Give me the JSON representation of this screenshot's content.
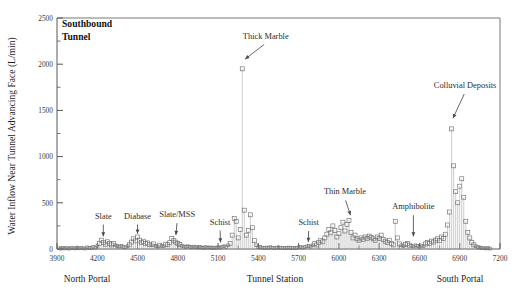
{
  "figure": {
    "panel_title_line1": "Southbound",
    "panel_title_line2": "Tunnel",
    "left_portal_label": "North Portal",
    "right_portal_label": "South Portal"
  },
  "chart_data": {
    "type": "scatter",
    "title": "Southbound Tunnel",
    "xlabel": "Tunnel Station",
    "ylabel": "Water Inflow Near Tunnel Advancing Face (L/min)",
    "xlim": [
      3900,
      7200
    ],
    "ylim": [
      0,
      2500
    ],
    "xticks": [
      3900,
      4200,
      4500,
      4800,
      5100,
      5400,
      5700,
      6000,
      6300,
      6600,
      6900,
      7200
    ],
    "yticks": [
      0,
      500,
      1000,
      1500,
      2000,
      2500
    ],
    "x_minor_interval": 150,
    "y_minor_interval": 250,
    "grid": false,
    "legend": "none",
    "marker_style": "open-square-with-dropline",
    "series": [
      {
        "name": "Water inflow near advancing face",
        "points": [
          [
            3915,
            8
          ],
          [
            3930,
            5
          ],
          [
            3945,
            12
          ],
          [
            3960,
            6
          ],
          [
            3975,
            10
          ],
          [
            3990,
            4
          ],
          [
            4005,
            14
          ],
          [
            4020,
            9
          ],
          [
            4035,
            6
          ],
          [
            4050,
            11
          ],
          [
            4065,
            7
          ],
          [
            4080,
            13
          ],
          [
            4095,
            8
          ],
          [
            4110,
            5
          ],
          [
            4125,
            18
          ],
          [
            4140,
            12
          ],
          [
            4155,
            9
          ],
          [
            4170,
            22
          ],
          [
            4185,
            15
          ],
          [
            4200,
            30
          ],
          [
            4215,
            62
          ],
          [
            4230,
            95
          ],
          [
            4245,
            70
          ],
          [
            4260,
            52
          ],
          [
            4275,
            78
          ],
          [
            4290,
            60
          ],
          [
            4305,
            44
          ],
          [
            4320,
            58
          ],
          [
            4335,
            40
          ],
          [
            4350,
            33
          ],
          [
            4365,
            26
          ],
          [
            4380,
            35
          ],
          [
            4395,
            22
          ],
          [
            4410,
            18
          ],
          [
            4425,
            30
          ],
          [
            4440,
            46
          ],
          [
            4455,
            75
          ],
          [
            4470,
            110
          ],
          [
            4485,
            88
          ],
          [
            4500,
            130
          ],
          [
            4515,
            96
          ],
          [
            4530,
            72
          ],
          [
            4545,
            84
          ],
          [
            4560,
            58
          ],
          [
            4575,
            66
          ],
          [
            4590,
            48
          ],
          [
            4605,
            40
          ],
          [
            4620,
            55
          ],
          [
            4635,
            34
          ],
          [
            4650,
            28
          ],
          [
            4665,
            42
          ],
          [
            4680,
            36
          ],
          [
            4695,
            30
          ],
          [
            4710,
            52
          ],
          [
            4725,
            46
          ],
          [
            4740,
            68
          ],
          [
            4755,
            115
          ],
          [
            4770,
            90
          ],
          [
            4785,
            74
          ],
          [
            4800,
            60
          ],
          [
            4815,
            48
          ],
          [
            4830,
            36
          ],
          [
            4845,
            28
          ],
          [
            4860,
            22
          ],
          [
            4875,
            30
          ],
          [
            4890,
            24
          ],
          [
            4905,
            18
          ],
          [
            4920,
            26
          ],
          [
            4935,
            20
          ],
          [
            4950,
            15
          ],
          [
            4965,
            22
          ],
          [
            4980,
            17
          ],
          [
            4995,
            12
          ],
          [
            5010,
            20
          ],
          [
            5025,
            14
          ],
          [
            5040,
            18
          ],
          [
            5055,
            10
          ],
          [
            5070,
            16
          ],
          [
            5085,
            12
          ],
          [
            5100,
            20
          ],
          [
            5115,
            14
          ],
          [
            5130,
            24
          ],
          [
            5145,
            30
          ],
          [
            5160,
            22
          ],
          [
            5175,
            40
          ],
          [
            5190,
            60
          ],
          [
            5205,
            150
          ],
          [
            5220,
            330
          ],
          [
            5235,
            300
          ],
          [
            5250,
            120
          ],
          [
            5265,
            210
          ],
          [
            5280,
            1950
          ],
          [
            5295,
            420
          ],
          [
            5310,
            150
          ],
          [
            5325,
            200
          ],
          [
            5340,
            370
          ],
          [
            5355,
            230
          ],
          [
            5370,
            90
          ],
          [
            5385,
            40
          ],
          [
            5400,
            18
          ],
          [
            5415,
            22
          ],
          [
            5430,
            14
          ],
          [
            5445,
            10
          ],
          [
            5460,
            16
          ],
          [
            5475,
            12
          ],
          [
            5490,
            20
          ],
          [
            5505,
            14
          ],
          [
            5520,
            8
          ],
          [
            5535,
            12
          ],
          [
            5550,
            18
          ],
          [
            5565,
            10
          ],
          [
            5580,
            14
          ],
          [
            5595,
            8
          ],
          [
            5610,
            12
          ],
          [
            5625,
            16
          ],
          [
            5640,
            10
          ],
          [
            5655,
            14
          ],
          [
            5670,
            8
          ],
          [
            5685,
            12
          ],
          [
            5700,
            18
          ],
          [
            5715,
            22
          ],
          [
            5730,
            14
          ],
          [
            5745,
            20
          ],
          [
            5760,
            28
          ],
          [
            5775,
            34
          ],
          [
            5790,
            26
          ],
          [
            5805,
            40
          ],
          [
            5820,
            58
          ],
          [
            5835,
            44
          ],
          [
            5850,
            70
          ],
          [
            5865,
            95
          ],
          [
            5880,
            78
          ],
          [
            5895,
            120
          ],
          [
            5910,
            160
          ],
          [
            5925,
            210
          ],
          [
            5940,
            175
          ],
          [
            5955,
            250
          ],
          [
            5970,
            200
          ],
          [
            5985,
            130
          ],
          [
            6000,
            165
          ],
          [
            6015,
            230
          ],
          [
            6030,
            290
          ],
          [
            6045,
            195
          ],
          [
            6060,
            265
          ],
          [
            6075,
            310
          ],
          [
            6090,
            180
          ],
          [
            6105,
            120
          ],
          [
            6120,
            150
          ],
          [
            6135,
            110
          ],
          [
            6150,
            95
          ],
          [
            6165,
            120
          ],
          [
            6180,
            105
          ],
          [
            6195,
            130
          ],
          [
            6210,
            115
          ],
          [
            6225,
            140
          ],
          [
            6240,
            125
          ],
          [
            6255,
            110
          ],
          [
            6270,
            95
          ],
          [
            6285,
            130
          ],
          [
            6300,
            115
          ],
          [
            6315,
            150
          ],
          [
            6330,
            105
          ],
          [
            6345,
            85
          ],
          [
            6360,
            70
          ],
          [
            6375,
            95
          ],
          [
            6390,
            60
          ],
          [
            6405,
            45
          ],
          [
            6420,
            300
          ],
          [
            6435,
            120
          ],
          [
            6450,
            55
          ],
          [
            6465,
            40
          ],
          [
            6480,
            30
          ],
          [
            6495,
            48
          ],
          [
            6510,
            60
          ],
          [
            6525,
            42
          ],
          [
            6540,
            35
          ],
          [
            6555,
            28
          ],
          [
            6570,
            40
          ],
          [
            6585,
            32
          ],
          [
            6600,
            25
          ],
          [
            6615,
            38
          ],
          [
            6630,
            30
          ],
          [
            6645,
            55
          ],
          [
            6660,
            70
          ],
          [
            6675,
            60
          ],
          [
            6690,
            85
          ],
          [
            6705,
            75
          ],
          [
            6720,
            95
          ],
          [
            6735,
            110
          ],
          [
            6750,
            90
          ],
          [
            6765,
            130
          ],
          [
            6780,
            115
          ],
          [
            6795,
            160
          ],
          [
            6810,
            260
          ],
          [
            6825,
            400
          ],
          [
            6840,
            1300
          ],
          [
            6855,
            900
          ],
          [
            6870,
            620
          ],
          [
            6885,
            500
          ],
          [
            6900,
            680
          ],
          [
            6915,
            760
          ],
          [
            6930,
            560
          ],
          [
            6945,
            300
          ],
          [
            6960,
            180
          ],
          [
            6975,
            120
          ],
          [
            6990,
            70
          ],
          [
            7005,
            45
          ],
          [
            7020,
            30
          ],
          [
            7035,
            20
          ],
          [
            7050,
            14
          ],
          [
            7065,
            10
          ],
          [
            7080,
            8
          ],
          [
            7095,
            6
          ],
          [
            7110,
            10
          ],
          [
            7125,
            5
          ]
        ]
      }
    ],
    "annotations": [
      {
        "label": "Slate",
        "x": 4245,
        "y": 330,
        "tip_x": 4245,
        "tip_y": 120
      },
      {
        "label": "Diabase",
        "x": 4500,
        "y": 330,
        "tip_x": 4500,
        "tip_y": 150
      },
      {
        "label": "Slate/MSS",
        "x": 4795,
        "y": 345,
        "tip_x": 4785,
        "tip_y": 135
      },
      {
        "label": "Schist",
        "x": 5115,
        "y": 265,
        "tip_x": 5118,
        "tip_y": 55
      },
      {
        "label": "Thick Marble",
        "x": 5455,
        "y": 2270,
        "tip_x": 5292,
        "tip_y": 2045
      },
      {
        "label": "Schist",
        "x": 5775,
        "y": 260,
        "tip_x": 5772,
        "tip_y": 60
      },
      {
        "label": "Thin Marble",
        "x": 6045,
        "y": 590,
        "tip_x": 6090,
        "tip_y": 350
      },
      {
        "label": "Amphibolite",
        "x": 6555,
        "y": 430,
        "tip_x": 6555,
        "tip_y": 120
      },
      {
        "label": "Colluvial Deposits",
        "x": 6940,
        "y": 1740,
        "tip_x": 6845,
        "tip_y": 1400
      }
    ]
  }
}
